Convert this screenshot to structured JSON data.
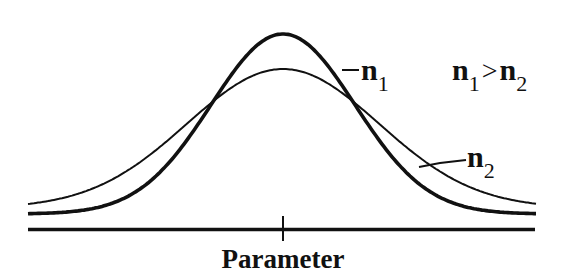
{
  "chart_data": {
    "type": "line",
    "title": "",
    "xlabel": "Parameter",
    "ylabel": "",
    "grid": false,
    "legend": null,
    "x_ticks": [
      {
        "position": "center",
        "label": ""
      }
    ],
    "series": [
      {
        "name": "n1",
        "label_main": "n",
        "label_sub": "1",
        "style": "thick",
        "distribution": "normal",
        "relative_peak_height": 1.0,
        "relative_spread": "narrower"
      },
      {
        "name": "n2",
        "label_main": "n",
        "label_sub": "2",
        "style": "thin",
        "distribution": "normal",
        "relative_peak_height": 0.81,
        "relative_spread": "wider"
      }
    ],
    "annotations": [
      {
        "text": "n1 > n2",
        "parts": {
          "a_main": "n",
          "a_sub": "1",
          "op": ">",
          "b_main": "n",
          "b_sub": "2"
        }
      }
    ]
  },
  "labels": {
    "x_axis": "Parameter",
    "n1_main": "n",
    "n1_sub": "1",
    "n2_main": "n",
    "n2_sub": "2",
    "cmp_a_main": "n",
    "cmp_a_sub": "1",
    "cmp_op": ">",
    "cmp_b_main": "n",
    "cmp_b_sub": "2"
  },
  "colors": {
    "ink": "#111111",
    "background": "#ffffff"
  }
}
